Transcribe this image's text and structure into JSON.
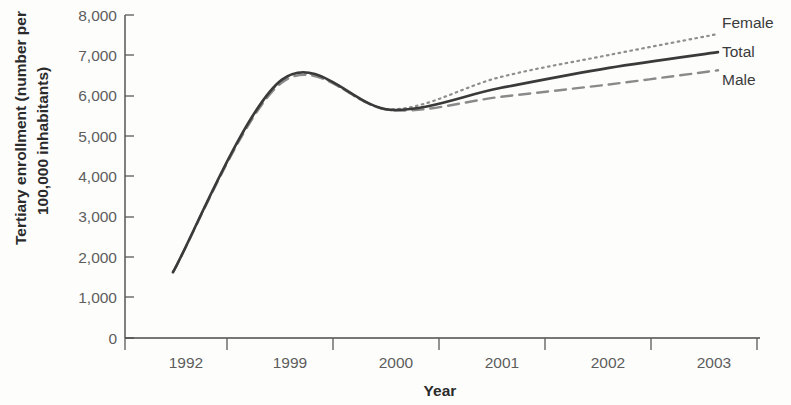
{
  "chart_data": {
    "type": "line",
    "title": "",
    "xlabel": "Year",
    "ylabel": "Tertiary enrollment (number per 100,000 inhabitants)",
    "categories": [
      "1992",
      "1999",
      "2000",
      "2001",
      "2002",
      "2003"
    ],
    "ylim": [
      0,
      8000
    ],
    "ytick_labels": [
      "0",
      "1,000",
      "2,000",
      "3,000",
      "4,000",
      "5,000",
      "6,000",
      "7,000",
      "8,000"
    ],
    "ytick_values": [
      0,
      1000,
      2000,
      3000,
      4000,
      5000,
      6000,
      7000,
      8000
    ],
    "grid": false,
    "legend_position": "right-inline-end-of-line",
    "series": [
      {
        "name": "Female",
        "style": "dotted",
        "color": "#8e8e8e",
        "values": [
          1630,
          6380,
          5660,
          6460,
          7010,
          7530
        ]
      },
      {
        "name": "Total",
        "style": "solid",
        "color": "#3a3a3a",
        "values": [
          1630,
          6400,
          5650,
          6190,
          6690,
          7080
        ]
      },
      {
        "name": "Male",
        "style": "dashed",
        "color": "#8a8a8a",
        "values": [
          1630,
          6330,
          5640,
          5970,
          6280,
          6630
        ]
      }
    ]
  },
  "axes": {
    "y_title": "Tertiary enrollment (number per 100,000 inhabitants)",
    "y_title_line1": "Tertiary enrollment (number per",
    "y_title_line2": "100,000 inhabitants)",
    "x_title": "Year"
  },
  "ticks": {
    "y": [
      "8,000",
      "7,000",
      "6,000",
      "5,000",
      "4,000",
      "3,000",
      "2,000",
      "1,000",
      "0"
    ],
    "x": [
      "1992",
      "1999",
      "2000",
      "2001",
      "2002",
      "2003"
    ]
  },
  "legend": {
    "female": "Female",
    "total": "Total",
    "male": "Male"
  }
}
